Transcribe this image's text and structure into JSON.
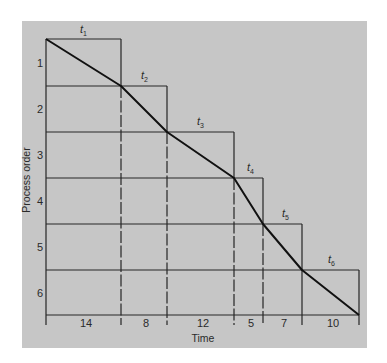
{
  "figure": {
    "y_axis_label": "Process order",
    "x_axis_label": "Time",
    "process_labels": [
      "1",
      "2",
      "3",
      "4",
      "5",
      "6"
    ],
    "task_labels": [
      {
        "base": "t",
        "sub": "1"
      },
      {
        "base": "t",
        "sub": "2"
      },
      {
        "base": "t",
        "sub": "3"
      },
      {
        "base": "t",
        "sub": "4"
      },
      {
        "base": "t",
        "sub": "5"
      },
      {
        "base": "t",
        "sub": "6"
      }
    ],
    "durations": [
      "14",
      "8",
      "12",
      "5",
      "7",
      "10"
    ],
    "colors": {
      "panel": "#c6c6c6",
      "line": "#222222",
      "curve": "#111111"
    }
  }
}
